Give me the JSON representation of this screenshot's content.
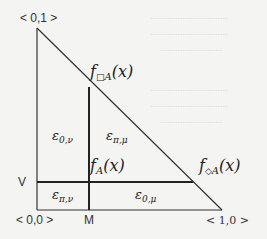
{
  "diagram": {
    "type": "partitioned-triangle",
    "vertices": {
      "top_left": "< 0,1 >",
      "origin": "< 0,0 >",
      "bottom_right": "< 1,0 >"
    },
    "axis_marks": {
      "vertical_threshold": "V",
      "horizontal_threshold": "M"
    },
    "curves": {
      "box": {
        "f": "f",
        "op": "□",
        "sub": "A",
        "arg": "(x)"
      },
      "plain": {
        "f": "f",
        "op": "",
        "sub": "A",
        "arg": "(x)"
      },
      "diamond": {
        "f": "f",
        "op": "◇",
        "sub": "A",
        "arg": "(x)"
      }
    },
    "regions": {
      "upper_left": {
        "symbol": "ε",
        "sub": "0,ν"
      },
      "upper_right": {
        "symbol": "ε",
        "sub": "π,μ"
      },
      "lower_left": {
        "symbol": "ε",
        "sub": "π,ν"
      },
      "lower_right": {
        "symbol": "ε",
        "sub": "0,μ"
      }
    },
    "colors": {
      "line": "#222222",
      "background": "#f4f4f2"
    }
  }
}
